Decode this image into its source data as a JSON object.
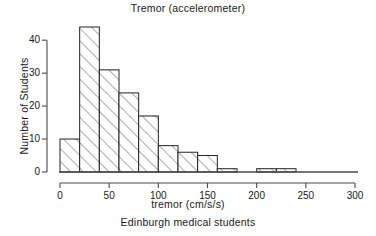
{
  "chart_data": {
    "type": "bar",
    "title": "Tremor (accelerometer)",
    "subtitle": "Edinburgh medical students",
    "xlabel": "tremor (cm/s/s)",
    "ylabel": "Number of Students",
    "xlim": [
      0,
      300
    ],
    "ylim": [
      0,
      46
    ],
    "grid": false,
    "legend": null,
    "bin_width": 20,
    "categories": [
      "0-20",
      "20-40",
      "40-60",
      "60-80",
      "80-100",
      "100-120",
      "120-140",
      "140-160",
      "160-180",
      "180-200",
      "200-220",
      "220-240"
    ],
    "x": [
      0,
      20,
      40,
      60,
      80,
      100,
      120,
      140,
      160,
      180,
      200,
      220
    ],
    "values": [
      10,
      44,
      31,
      24,
      17,
      8,
      6,
      5,
      1,
      0,
      1,
      1
    ],
    "xticks": [
      0,
      50,
      100,
      150,
      200,
      250,
      300
    ],
    "xtick_labels": [
      "0",
      "50",
      "100",
      "150",
      "200",
      "250",
      "300"
    ],
    "yticks": [
      0,
      10,
      20,
      30,
      40
    ],
    "ytick_labels": [
      "0",
      "10",
      "20",
      "30",
      "40"
    ],
    "bar_style": "diagonal-hatch",
    "bar_fill": "#ffffff",
    "bar_stroke": "#222222",
    "hatch_color": "#444444",
    "axis_color": "#4a4a4a",
    "total_students": 148
  }
}
